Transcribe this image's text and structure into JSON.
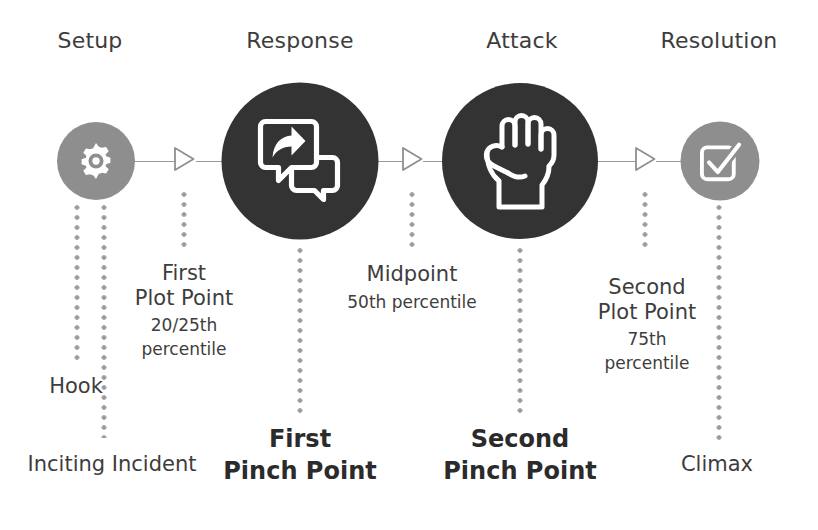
{
  "diagram": {
    "colors": {
      "light_node": "#8e8e8e",
      "dark_node": "#333333",
      "text": "#3d3d3d",
      "bold_text": "#2b2b2b",
      "line": "#9a9a9a",
      "background": "#ffffff"
    },
    "stages": [
      {
        "label": "Setup",
        "icon": "gear-icon",
        "tone": "light",
        "cx": 96,
        "d": 78
      },
      {
        "label": "Response",
        "icon": "speech-share-icon",
        "tone": "dark",
        "cx": 300,
        "d": 157
      },
      {
        "label": "Attack",
        "icon": "fist-icon",
        "tone": "dark",
        "cx": 520,
        "d": 156
      },
      {
        "label": "Resolution",
        "icon": "checkbox-check-icon",
        "tone": "light",
        "cx": 720,
        "d": 79
      }
    ],
    "arrows": [
      {
        "name": "arrow-setup-to-response",
        "cx": 184
      },
      {
        "name": "arrow-response-to-attack",
        "cx": 412
      },
      {
        "name": "arrow-attack-to-resolution",
        "cx": 645
      }
    ],
    "markers": [
      {
        "name": "hook",
        "lines": [
          {
            "text": "Hook",
            "size": "big"
          }
        ],
        "style": "plain",
        "x": 76,
        "y": 374,
        "leader": {
          "x": 77,
          "top": 205,
          "height": 155
        }
      },
      {
        "name": "inciting-incident",
        "lines": [
          {
            "text": "Inciting Incident",
            "size": "big"
          }
        ],
        "style": "plain",
        "x": 112,
        "y": 452,
        "leader": {
          "x": 104,
          "top": 205,
          "height": 233
        }
      },
      {
        "name": "first-plot-point",
        "lines": [
          {
            "text": "First",
            "size": "big"
          },
          {
            "text": "Plot Point",
            "size": "big"
          },
          {
            "text": "20/25th",
            "size": "small"
          },
          {
            "text": "percentile",
            "size": "small"
          }
        ],
        "style": "multi",
        "x": 184,
        "y": 261,
        "leader": {
          "x": 184,
          "top": 192,
          "height": 58
        }
      },
      {
        "name": "first-pinch-point",
        "lines": [
          {
            "text": "First",
            "size": "big"
          },
          {
            "text": "Pinch Point",
            "size": "big"
          }
        ],
        "style": "bold",
        "x": 300,
        "y": 424,
        "leader": {
          "x": 300,
          "top": 248,
          "height": 166
        }
      },
      {
        "name": "midpoint",
        "lines": [
          {
            "text": "Midpoint",
            "size": "big"
          },
          {
            "text": "50th percentile",
            "size": "small"
          }
        ],
        "style": "multi",
        "x": 412,
        "y": 262,
        "leader": {
          "x": 412,
          "top": 192,
          "height": 58
        }
      },
      {
        "name": "second-pinch-point",
        "lines": [
          {
            "text": "Second",
            "size": "big"
          },
          {
            "text": "Pinch Point",
            "size": "big"
          }
        ],
        "style": "bold",
        "x": 520,
        "y": 424,
        "leader": {
          "x": 520,
          "top": 248,
          "height": 166
        }
      },
      {
        "name": "second-plot-point",
        "lines": [
          {
            "text": "Second",
            "size": "big"
          },
          {
            "text": "Plot Point",
            "size": "big"
          },
          {
            "text": "75th",
            "size": "small"
          },
          {
            "text": "percentile",
            "size": "small"
          }
        ],
        "style": "multi",
        "x": 647,
        "y": 275,
        "leader": {
          "x": 645,
          "top": 192,
          "height": 58
        }
      },
      {
        "name": "climax",
        "lines": [
          {
            "text": "Climax",
            "size": "big"
          }
        ],
        "style": "plain",
        "x": 717,
        "y": 452,
        "leader": {
          "x": 719,
          "top": 205,
          "height": 238
        }
      }
    ]
  }
}
